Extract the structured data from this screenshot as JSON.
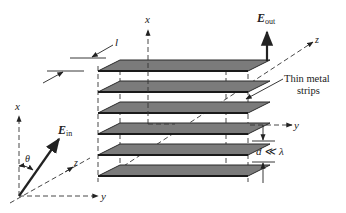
{
  "figure": {
    "type": "3D schematic of wire-grid polarizer",
    "labels": {
      "x_axis_stack": "x",
      "z_axis_stack": "z",
      "y_axis_stack": "y",
      "E_out_main": "E",
      "E_out_sub": "out",
      "thin_metal_line1": "Thin metal",
      "thin_metal_line2": "strips",
      "spacing": "d ≪ λ",
      "length": "l",
      "x_axis_left": "x",
      "y_axis_left": "y",
      "z_axis_left": "z",
      "E_in_main": "E",
      "E_in_sub": "in",
      "angle": "θ"
    },
    "plate_count": 6,
    "colors": {
      "plate_fill": "#7b7b7b",
      "line": "#222222",
      "background": "#ffffff"
    }
  }
}
